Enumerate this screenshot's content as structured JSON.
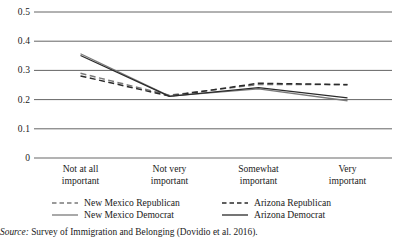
{
  "chart_data": {
    "type": "line",
    "title": "",
    "xlabel": "",
    "ylabel": "",
    "categories": [
      "Not at all important",
      "Not very important",
      "Somewhat important",
      "Very important"
    ],
    "category_lines": [
      [
        "Not at all",
        "important"
      ],
      [
        "Not very",
        "important"
      ],
      [
        "Somewhat",
        "important"
      ],
      [
        "Very",
        "important"
      ]
    ],
    "yticks": [
      "0",
      "0.1",
      "0.2",
      "0.3",
      "0.4",
      "0.5"
    ],
    "ytick_values": [
      0,
      0.1,
      0.2,
      0.3,
      0.4,
      0.5
    ],
    "ylim": [
      0,
      0.5
    ],
    "grid": "horizontal",
    "legend_position": "bottom",
    "series": [
      {
        "name": "New Mexico Republican",
        "style": "dashed",
        "color": "#7a7a7a",
        "values": [
          0.29,
          0.215,
          0.252,
          0.252
        ]
      },
      {
        "name": "Arizona Republican",
        "style": "dashed",
        "color": "#2b2b2b",
        "values": [
          0.281,
          0.212,
          0.256,
          0.251
        ]
      },
      {
        "name": "New Mexico Democrat",
        "style": "solid",
        "color": "#7a7a7a",
        "values": [
          0.357,
          0.212,
          0.237,
          0.196
        ]
      },
      {
        "name": "Arizona Democrat",
        "style": "solid",
        "color": "#2b2b2b",
        "values": [
          0.351,
          0.211,
          0.241,
          0.206
        ]
      }
    ]
  },
  "legend": {
    "items": [
      {
        "label": "New Mexico Republican",
        "style": "dashed",
        "color": "#7a7a7a"
      },
      {
        "label": "Arizona Republican",
        "style": "dashed",
        "color": "#2b2b2b"
      },
      {
        "label": "New Mexico Democrat",
        "style": "solid",
        "color": "#7a7a7a"
      },
      {
        "label": "Arizona Democrat",
        "style": "solid",
        "color": "#2b2b2b"
      }
    ]
  },
  "source": {
    "prefix": "Source:",
    "text": " Survey of Immigration and Belonging (Dovidio et al. 2016)."
  },
  "colors": {
    "gridline": "#3d3d3d",
    "axis": "#9a9a9a",
    "text": "#1a1a1a",
    "light_series": "#7a7a7a",
    "dark_series": "#2b2b2b"
  }
}
